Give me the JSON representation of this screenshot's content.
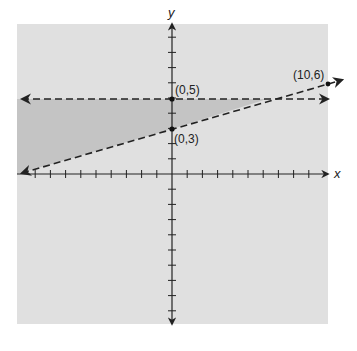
{
  "chart_data": {
    "type": "line",
    "title": "",
    "xlabel": "x",
    "ylabel": "y",
    "xlim": [
      -10,
      10
    ],
    "ylim": [
      -10,
      10
    ],
    "tick_interval": 1,
    "grid": false,
    "legend": null,
    "series": [
      {
        "name": "y = 5",
        "style": "dashed",
        "points": [
          [
            -10,
            5
          ],
          [
            10,
            5
          ]
        ],
        "arrows": "both"
      },
      {
        "name": "y = 0.3x + 3",
        "style": "dashed",
        "points": [
          [
            -10,
            0
          ],
          [
            10,
            6
          ]
        ],
        "arrows": "both"
      }
    ],
    "shaded_region": {
      "description": "region below y = 5 and above y = 0.3x + 3, to the left of the intersection",
      "color": "#c4c4c4"
    },
    "annotations": [
      {
        "text": "(0,5)",
        "x": 0,
        "y": 5
      },
      {
        "text": "(0,3)",
        "x": 0,
        "y": 3
      },
      {
        "text": "(10,6)",
        "x": 10,
        "y": 6
      }
    ]
  },
  "labels": {
    "x_axis": "x",
    "y_axis": "y",
    "p05": "(0,5)",
    "p03": "(0,3)",
    "p106": "(10,6)"
  },
  "colors": {
    "plot_background": "#e0e0e0",
    "shaded": "#c4c4c4",
    "ink": "#222222"
  }
}
